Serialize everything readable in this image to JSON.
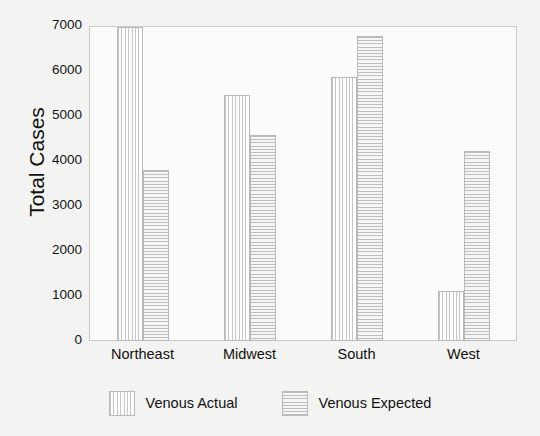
{
  "chart_data": {
    "type": "bar",
    "title": "",
    "xlabel": "",
    "ylabel": "Total Cases",
    "ylim": [
      0,
      7000
    ],
    "yticks": [
      0,
      1000,
      2000,
      3000,
      4000,
      5000,
      6000,
      7000
    ],
    "ytick_labels": [
      "0",
      "1000",
      "2000",
      "3000",
      "4000",
      "5000",
      "6000",
      "7000"
    ],
    "grid": false,
    "legend_position": "bottom",
    "categories": [
      "Northeast",
      "Midwest",
      "South",
      "West"
    ],
    "series": [
      {
        "name": "Venous Actual",
        "pattern": "vertical-lines",
        "values": [
          6980,
          5470,
          5860,
          1110
        ]
      },
      {
        "name": "Venous Expected",
        "pattern": "horizontal-lines",
        "values": [
          3790,
          4580,
          6770,
          4230
        ]
      }
    ]
  },
  "colors": {
    "page_background": "#f3f3f2",
    "plot_background": "#fbfbfa",
    "frame": "#c9c9c7",
    "bar_outline": "#b9b9b7",
    "hatch": "#c6c6c4",
    "text": "#111111"
  }
}
